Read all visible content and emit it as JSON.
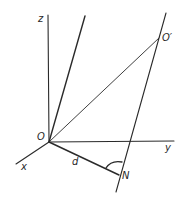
{
  "diagram": {
    "type": "3d-geometry",
    "labels": {
      "z_axis": "z",
      "x_axis": "x",
      "y_axis": "y",
      "origin": "O",
      "point_o_prime": "O′",
      "point_n": "N",
      "distance": "d"
    },
    "line_color": "#2a2a2a"
  }
}
